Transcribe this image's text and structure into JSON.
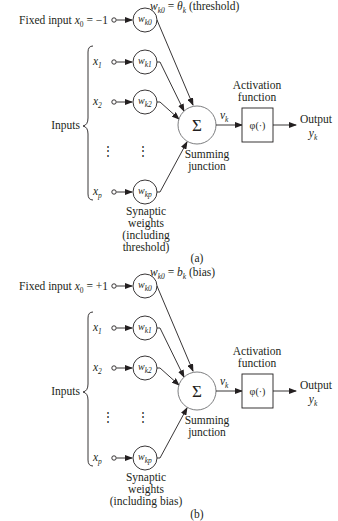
{
  "figure": {
    "panels": [
      {
        "id": "a",
        "caption": "(a)",
        "fixed_input": {
          "prefix": "Fixed input ",
          "var": "x",
          "sub": "0",
          "suffix": " = −1"
        },
        "bias_label": {
          "var": "w",
          "sub": "k0",
          "mid": " = θ",
          "sub2": "k",
          "suffix": " (threshold)"
        },
        "weights_note": [
          "Synaptic",
          "weights",
          "(including",
          "threshold)"
        ]
      },
      {
        "id": "b",
        "caption": "(b)",
        "fixed_input": {
          "prefix": "Fixed input ",
          "var": "x",
          "sub": "0",
          "suffix": " = +1"
        },
        "bias_label": {
          "var": "w",
          "sub": "k0",
          "mid": " = b",
          "sub2": "k",
          "suffix": " (bias)"
        },
        "weights_note": [
          "Synaptic",
          "weights",
          "(including bias)"
        ]
      }
    ],
    "inputs_label": "Inputs",
    "inputs": [
      {
        "var": "x",
        "sub": "1",
        "weight": "w",
        "wsub": "k1"
      },
      {
        "var": "x",
        "sub": "2",
        "weight": "w",
        "wsub": "k2"
      },
      {
        "var": "x",
        "sub": "p",
        "weight": "w",
        "wsub": "kp"
      }
    ],
    "fixed_weight": {
      "weight": "w",
      "wsub": "k0"
    },
    "ellipsis": "⋮",
    "sum_symbol": "Σ",
    "summing_label": [
      "Summing",
      "junction"
    ],
    "induced_field": {
      "var": "v",
      "sub": "k"
    },
    "activation_label": [
      "Activation",
      "function"
    ],
    "activation_symbol": "φ(·)",
    "output_label": "Output",
    "output_var": {
      "var": "y",
      "sub": "k"
    }
  }
}
